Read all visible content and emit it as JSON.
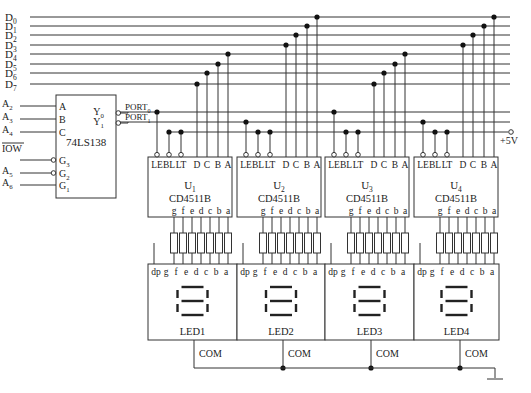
{
  "bus_labels": [
    "D0",
    "D1",
    "D2",
    "D3",
    "D4",
    "D5",
    "D6",
    "D7"
  ],
  "decoder": {
    "name": "74LS138",
    "inputs_left": [
      {
        "signal": "A2",
        "pin": "A"
      },
      {
        "signal": "A3",
        "pin": "B"
      },
      {
        "signal": "A4",
        "pin": "C"
      },
      {
        "signal": "IOW",
        "pin": "G3",
        "overline": true,
        "inverted": true
      },
      {
        "signal": "A5",
        "pin": "G2",
        "inverted": true
      },
      {
        "signal": "A6",
        "pin": "G1"
      }
    ],
    "outputs": [
      {
        "pin": "Y0",
        "net": "PORT0"
      },
      {
        "pin": "Y1",
        "net": "PORT1"
      }
    ]
  },
  "drivers": [
    {
      "ref": "U1",
      "part": "CD4511B",
      "led": "LED1",
      "port": "PORT0"
    },
    {
      "ref": "U2",
      "part": "CD4511B",
      "led": "LED2",
      "port": "PORT1"
    },
    {
      "ref": "U3",
      "part": "CD4511B",
      "led": "LED3",
      "port": "PORT0"
    },
    {
      "ref": "U4",
      "part": "CD4511B",
      "led": "LED4",
      "port": "PORT1"
    }
  ],
  "driver_input_pins": [
    "LE",
    "BL",
    "LT",
    "D",
    "C",
    "B",
    "A"
  ],
  "driver_output_pins": [
    "g",
    "f",
    "e",
    "d",
    "c",
    "b",
    "a"
  ],
  "led_pins": [
    "dp",
    "g",
    "f",
    "e",
    "d",
    "c",
    "b",
    "a"
  ],
  "com_label": "COM",
  "power_label": "+5V"
}
